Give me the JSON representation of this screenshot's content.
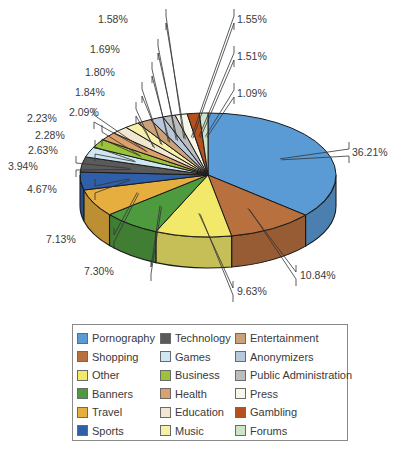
{
  "chart_data": {
    "type": "pie",
    "style": "3d-exploded-labels",
    "title": "",
    "categories": [
      "Pornography",
      "Shopping",
      "Other",
      "Banners",
      "Travel",
      "Sports",
      "Technology",
      "Games",
      "Business",
      "Health",
      "Education",
      "Music",
      "Entertainment",
      "Anonymizers",
      "Public Administration",
      "Press",
      "Gambling",
      "Forums"
    ],
    "values": [
      36.21,
      10.84,
      9.63,
      7.3,
      7.13,
      4.67,
      3.94,
      2.63,
      2.28,
      2.23,
      2.09,
      1.84,
      1.8,
      1.69,
      1.58,
      1.55,
      1.51,
      1.09
    ],
    "labels": [
      "36.21%",
      "10.84%",
      "9.63%",
      "7.30%",
      "7.13%",
      "4.67%",
      "3.94%",
      "2.63%",
      "2.28%",
      "2.23%",
      "2.09%",
      "1.84%",
      "1.80%",
      "1.69%",
      "1.58%",
      "1.55%",
      "1.51%",
      "1.09%"
    ],
    "colors": [
      "#5b9bd5",
      "#b8703e",
      "#f2e86a",
      "#4e9a3e",
      "#e6ae3e",
      "#2f5fa8",
      "#5a5a5a",
      "#cfe6f3",
      "#9cc23a",
      "#dca06a",
      "#f1e6cf",
      "#f6f0a8",
      "#caa27a",
      "#b9c9dc",
      "#bdbdbd",
      "#f7f7e8",
      "#b5501f",
      "#cfe3c9"
    ],
    "legend_position": "bottom",
    "legend": {
      "columns": [
        [
          "Pornography",
          "Shopping",
          "Other",
          "Banners",
          "Travel",
          "Sports"
        ],
        [
          "Technology",
          "Games",
          "Business",
          "Health",
          "Education",
          "Music"
        ],
        [
          "Entertainment",
          "Anonymizers",
          "Public Administration",
          "Press",
          "Gambling",
          "Forums"
        ]
      ]
    }
  },
  "layout": {
    "pie": {
      "cx": 208,
      "cy": 175,
      "rx": 128,
      "ry": 62,
      "depth": 31,
      "start_deg": -90
    },
    "label_anchors": [
      {
        "x": 349,
        "y": 152,
        "tx": 352,
        "ty": 156
      },
      {
        "x": 296,
        "y": 275,
        "tx": 300,
        "ty": 279
      },
      {
        "x": 233,
        "y": 291,
        "tx": 237,
        "ty": 295
      },
      {
        "x": 117,
        "y": 270,
        "tx": 84,
        "ty": 275
      },
      {
        "x": 80,
        "y": 238,
        "tx": 46,
        "ty": 243
      },
      {
        "x": 61,
        "y": 189,
        "tx": 27,
        "ty": 193
      },
      {
        "x": 42,
        "y": 166,
        "tx": 8,
        "ty": 170
      },
      {
        "x": 61,
        "y": 150,
        "tx": 28,
        "ty": 154
      },
      {
        "x": 68,
        "y": 135,
        "tx": 35,
        "ty": 139
      },
      {
        "x": 60,
        "y": 118,
        "tx": 27,
        "ty": 122
      },
      {
        "x": 102,
        "y": 112,
        "tx": 69,
        "ty": 116
      },
      {
        "x": 108,
        "y": 92,
        "tx": 75,
        "ty": 96
      },
      {
        "x": 118,
        "y": 72,
        "tx": 85,
        "ty": 76
      },
      {
        "x": 124,
        "y": 49,
        "tx": 90,
        "ty": 53
      },
      {
        "x": 132,
        "y": 19,
        "tx": 98,
        "ty": 23
      },
      {
        "x": 234,
        "y": 19,
        "tx": 237,
        "ty": 23
      },
      {
        "x": 234,
        "y": 56,
        "tx": 237,
        "ty": 60
      },
      {
        "x": 234,
        "y": 93,
        "tx": 237,
        "ty": 97
      }
    ]
  }
}
